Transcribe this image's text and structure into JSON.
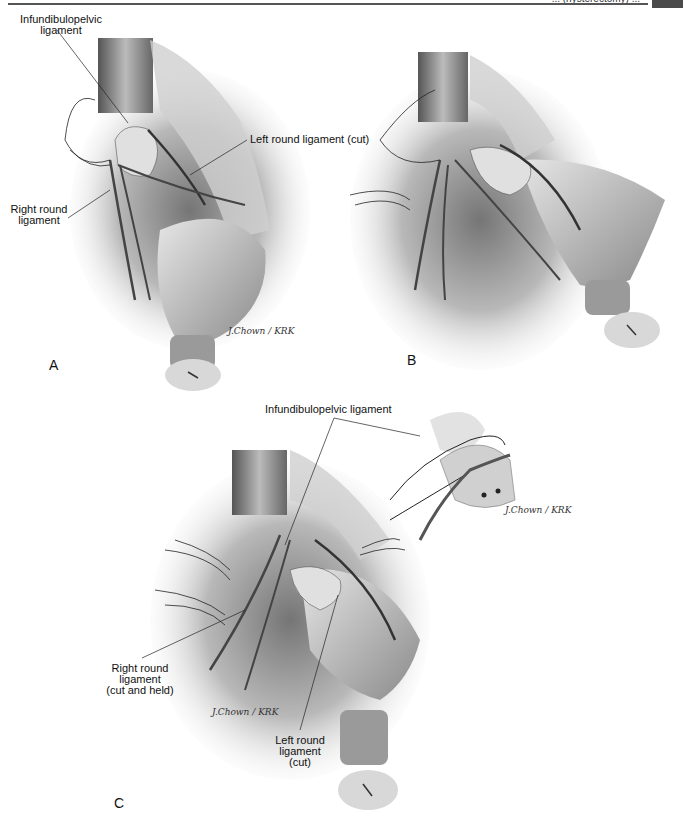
{
  "page": {
    "header_text": "... (hysterectomy) ...",
    "header_tab_color": "#4a4a4a"
  },
  "figure": {
    "panels": [
      {
        "id": "A",
        "letter": "A",
        "labels": {
          "infundibulopelvic": "Infundibulopelvic\nligament",
          "left_round": "Left round ligament (cut)",
          "right_round": "Right round\nligament"
        },
        "signature": "J.Chown / KRK"
      },
      {
        "id": "B",
        "letter": "B"
      },
      {
        "id": "C",
        "letter": "C",
        "labels": {
          "infundibulopelvic": "Infundibulopelvic ligament",
          "right_round": "Right round\nligament\n(cut and held)",
          "left_round": "Left round\nligament\n(cut)"
        },
        "signature": "J.Chown / KRK",
        "inset_signature": "J.Chown / KRK"
      }
    ]
  }
}
